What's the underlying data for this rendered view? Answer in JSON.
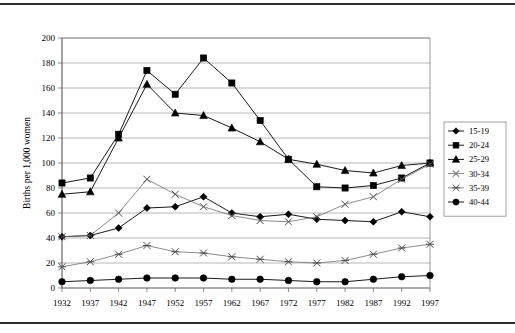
{
  "figure": {
    "background_color": "#ffffff",
    "frame_rule_color": "#2b2b2b",
    "plot_border_color": "#808080",
    "gridline_color": "#a6a6a6",
    "series_line_color": "#000000"
  },
  "chart_data": {
    "type": "line",
    "title": "",
    "xlabel": "",
    "ylabel": "Births per 1,000 women",
    "categories": [
      "1932",
      "1937",
      "1942",
      "1947",
      "1952",
      "1957",
      "1962",
      "1967",
      "1972",
      "1977",
      "1982",
      "1987",
      "1992",
      "1997"
    ],
    "x": [
      1932,
      1937,
      1942,
      1947,
      1952,
      1957,
      1962,
      1967,
      1972,
      1977,
      1982,
      1987,
      1992,
      1997
    ],
    "ylim": [
      0,
      200
    ],
    "ytick_step": 20,
    "yticks": [
      "0",
      "20",
      "40",
      "60",
      "80",
      "100",
      "120",
      "140",
      "160",
      "180",
      "200"
    ],
    "grid": "horizontal",
    "legend_position": "right-outside",
    "series": [
      {
        "name": "15-19",
        "marker": "diamond",
        "values": [
          41,
          42,
          48,
          64,
          65,
          73,
          60,
          57,
          59,
          55,
          54,
          53,
          61,
          57
        ]
      },
      {
        "name": "20-24",
        "marker": "square",
        "values": [
          84,
          88,
          123,
          174,
          155,
          184,
          164,
          134,
          103,
          81,
          80,
          82,
          88,
          100
        ]
      },
      {
        "name": "25-29",
        "marker": "triangle",
        "values": [
          75,
          77,
          120,
          163,
          140,
          138,
          128,
          117,
          103,
          99,
          94,
          92,
          98,
          100
        ]
      },
      {
        "name": "30-34",
        "marker": "x-mark",
        "values": [
          41,
          42,
          60,
          87,
          75,
          65,
          58,
          54,
          53,
          57,
          67,
          73,
          87,
          99
        ]
      },
      {
        "name": "35-39",
        "marker": "asterisk",
        "values": [
          17,
          21,
          27,
          34,
          29,
          28,
          25,
          23,
          21,
          20,
          22,
          27,
          32,
          35
        ]
      },
      {
        "name": "40-44",
        "marker": "circle",
        "values": [
          5,
          6,
          7,
          8,
          8,
          8,
          7,
          7,
          6,
          5,
          5,
          7,
          9,
          10
        ]
      }
    ]
  },
  "legend": {
    "entries": [
      {
        "label": "15-19",
        "marker": "diamond"
      },
      {
        "label": "20-24",
        "marker": "square"
      },
      {
        "label": "25-29",
        "marker": "triangle"
      },
      {
        "label": "30-34",
        "marker": "x-mark"
      },
      {
        "label": "35-39",
        "marker": "asterisk"
      },
      {
        "label": "40-44",
        "marker": "circle"
      }
    ]
  }
}
